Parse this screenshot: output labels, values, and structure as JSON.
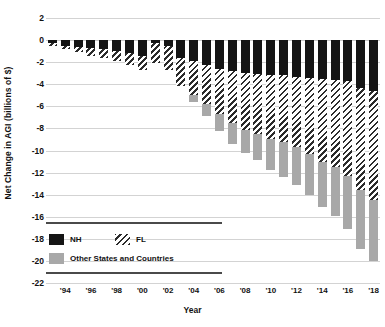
{
  "chart_data": {
    "type": "bar",
    "stacked": true,
    "orientation": "vertical",
    "title": "",
    "xlabel": "Year",
    "ylabel": "Net Change in AGI (billions of $)",
    "ylim": [
      -22,
      2
    ],
    "ytick_values": [
      2,
      0,
      -2,
      -4,
      -6,
      -8,
      -10,
      -12,
      -14,
      -16,
      -18,
      -20,
      -22
    ],
    "ytick_labels": [
      "2",
      "0",
      "-2",
      "-4",
      "-6",
      "-8",
      "-10",
      "-12",
      "-14",
      "-16",
      "-18",
      "-20",
      "-22"
    ],
    "grid": true,
    "grid_axis": "y",
    "legend_position": "lower-left-inside",
    "x": [
      1993,
      1994,
      1995,
      1996,
      1997,
      1998,
      1999,
      2000,
      2001,
      2002,
      2003,
      2004,
      2005,
      2006,
      2007,
      2008,
      2009,
      2010,
      2011,
      2012,
      2013,
      2014,
      2015,
      2016,
      2017,
      2018
    ],
    "categories": [
      "1993",
      "1994",
      "1995",
      "1996",
      "1997",
      "1998",
      "1999",
      "2000",
      "2001",
      "2002",
      "2003",
      "2004",
      "2005",
      "2006",
      "2007",
      "2008",
      "2009",
      "2010",
      "2011",
      "2012",
      "2013",
      "2014",
      "2015",
      "2016",
      "2017",
      "2018"
    ],
    "xtick_labels": [
      "'94",
      "'96",
      "'98",
      "'00",
      "'02",
      "'04",
      "'06",
      "'08",
      "'10",
      "'12",
      "'14",
      "'16",
      "'18"
    ],
    "xtick_years": [
      1994,
      1996,
      1998,
      2000,
      2002,
      2004,
      2006,
      2008,
      2010,
      2012,
      2014,
      2016,
      2018
    ],
    "series": [
      {
        "name": "NH",
        "key": "nh",
        "color": "#151515",
        "pattern": "solid",
        "values": [
          -0.3,
          -0.5,
          -0.6,
          -0.7,
          -0.8,
          -1.0,
          -1.2,
          -1.4,
          -0.3,
          -0.5,
          -1.6,
          -1.9,
          -2.3,
          -2.6,
          -2.8,
          -3.0,
          -3.1,
          -3.2,
          -3.2,
          -3.3,
          -3.4,
          -3.5,
          -3.6,
          -3.7,
          -4.3,
          -4.6
        ]
      },
      {
        "name": "FL",
        "key": "fl",
        "color": "#2b2b2b",
        "pattern": "diagonal-hatch",
        "values": [
          -0.2,
          -0.3,
          -0.5,
          -0.7,
          -0.8,
          -0.9,
          -1.1,
          -1.3,
          -1.8,
          -2.2,
          -2.6,
          -3.1,
          -3.5,
          -4.1,
          -4.7,
          -5.1,
          -5.4,
          -5.8,
          -6.0,
          -6.4,
          -6.9,
          -7.5,
          -7.9,
          -8.6,
          -9.3,
          -9.9
        ]
      },
      {
        "name": "Other States and Countries",
        "key": "other",
        "color": "#a8a8a8",
        "pattern": "solid",
        "values": [
          0.0,
          0.0,
          0.0,
          0.0,
          0.0,
          0.0,
          0.0,
          0.0,
          0.0,
          0.0,
          0.0,
          -0.6,
          -1.1,
          -1.5,
          -1.9,
          -2.1,
          -2.4,
          -2.8,
          -3.2,
          -3.4,
          -3.7,
          -4.1,
          -4.4,
          -4.8,
          -5.3,
          -5.5
        ]
      }
    ],
    "totals": [
      -0.5,
      -0.8,
      -1.1,
      -1.4,
      -1.6,
      -1.9,
      -2.3,
      -2.7,
      -2.1,
      -2.7,
      -4.2,
      -5.6,
      -6.9,
      -8.2,
      -9.4,
      -10.2,
      -10.9,
      -11.8,
      -12.4,
      -13.1,
      -14.0,
      -15.1,
      -15.9,
      -17.1,
      -18.9,
      -20.0
    ]
  },
  "legend": {
    "items": [
      {
        "label": "NH",
        "swatch": "nh-swatch"
      },
      {
        "label": "FL",
        "swatch": "fl-swatch"
      },
      {
        "label": "Other States and Countries",
        "swatch": "other-swatch"
      }
    ]
  },
  "axes": {
    "y_title": "Net Change in AGI (billions of $)",
    "x_title": "Year"
  }
}
